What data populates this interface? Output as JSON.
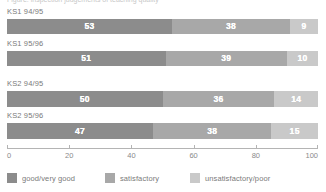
{
  "caption": {
    "cropped_line": "Figure: inspection judgements of teaching quality"
  },
  "chart_data": {
    "type": "bar",
    "orientation": "horizontal",
    "stacked": true,
    "title": "",
    "subtitle": "",
    "xlabel": "",
    "ylabel": "",
    "xlim": [
      0,
      100
    ],
    "grid": false,
    "legend_position": "bottom",
    "categories": [
      "KS1 94/95",
      "KS1 95/96",
      "KS2 94/95",
      "KS2 95/96"
    ],
    "series": [
      {
        "name": "good/very good",
        "color": "#8c8c8c",
        "values": [
          53,
          51,
          50,
          47
        ]
      },
      {
        "name": "satisfactory",
        "color": "#a8a8a8",
        "values": [
          38,
          39,
          36,
          38
        ]
      },
      {
        "name": "unsatisfactory/poor",
        "color": "#c9c9c9",
        "values": [
          9,
          10,
          14,
          15
        ]
      }
    ],
    "xticks": [
      0,
      20,
      40,
      60,
      80,
      100
    ],
    "xtick_labels": [
      "0",
      "20",
      "40",
      "60",
      "80",
      "100"
    ],
    "axis_color": "#b4b4b4",
    "value_label_color": "#ffffff",
    "text_color": "#7a7a7a",
    "background": "#ffffff"
  },
  "groups": [
    {
      "label": "KS1 94/95",
      "segments": [
        {
          "legend": "good/very good",
          "value": 53,
          "display": "53",
          "color": "#8c8c8c"
        },
        {
          "legend": "satisfactory",
          "value": 38,
          "display": "38",
          "color": "#a8a8a8"
        },
        {
          "legend": "unsatisfactory/poor",
          "value": 9,
          "display": "9",
          "color": "#c9c9c9"
        }
      ]
    },
    {
      "label": "KS1 95/96",
      "segments": [
        {
          "legend": "good/very good",
          "value": 51,
          "display": "51",
          "color": "#8c8c8c"
        },
        {
          "legend": "satisfactory",
          "value": 39,
          "display": "39",
          "color": "#a8a8a8"
        },
        {
          "legend": "unsatisfactory/poor",
          "value": 10,
          "display": "10",
          "color": "#c9c9c9"
        }
      ]
    },
    {
      "label": "KS2 94/95",
      "segments": [
        {
          "legend": "good/very good",
          "value": 50,
          "display": "50",
          "color": "#8c8c8c"
        },
        {
          "legend": "satisfactory",
          "value": 36,
          "display": "36",
          "color": "#a8a8a8"
        },
        {
          "legend": "unsatisfactory/poor",
          "value": 14,
          "display": "14",
          "color": "#c9c9c9"
        }
      ]
    },
    {
      "label": "KS2 95/96",
      "segments": [
        {
          "legend": "good/very good",
          "value": 47,
          "display": "47",
          "color": "#8c8c8c"
        },
        {
          "legend": "satisfactory",
          "value": 38,
          "display": "38",
          "color": "#a8a8a8"
        },
        {
          "legend": "unsatisfactory/poor",
          "value": 15,
          "display": "15",
          "color": "#c9c9c9"
        }
      ]
    }
  ],
  "axis": {
    "ticks": [
      {
        "value": 0,
        "label": "0"
      },
      {
        "value": 20,
        "label": "20"
      },
      {
        "value": 40,
        "label": "40"
      },
      {
        "value": 60,
        "label": "60"
      },
      {
        "value": 80,
        "label": "80"
      },
      {
        "value": 100,
        "label": "100"
      }
    ]
  },
  "legend": {
    "items": [
      {
        "label": "good/very good",
        "color": "#8c8c8c",
        "left": 0
      },
      {
        "label": "satisfactory",
        "color": "#a8a8a8",
        "left": 98
      },
      {
        "label": "unsatisfactory/poor",
        "color": "#c9c9c9",
        "left": 183
      }
    ]
  }
}
